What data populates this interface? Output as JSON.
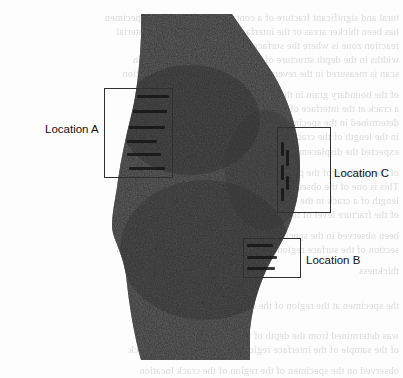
{
  "figure": {
    "type": "specimen-cross-section-micrograph",
    "background_color": "#fdfdfd",
    "specimen_fill_color": "#2e2e2e",
    "callout_stroke_color": "#303030",
    "label_color": "#111111"
  },
  "callouts": [
    {
      "id": "location-a",
      "label": "Location A",
      "box": {
        "x": 104,
        "y": 88,
        "width": 69,
        "height": 90
      },
      "label_pos": {
        "x": 45,
        "y": 124
      },
      "features": [
        {
          "x": 137,
          "y": 95,
          "width": 32,
          "height": 2.5
        },
        {
          "x": 133,
          "y": 110,
          "width": 34,
          "height": 3
        },
        {
          "x": 129,
          "y": 126,
          "width": 36,
          "height": 3
        },
        {
          "x": 127,
          "y": 140,
          "width": 30,
          "height": 2.5
        },
        {
          "x": 127,
          "y": 153,
          "width": 34,
          "height": 3
        },
        {
          "x": 129,
          "y": 167,
          "width": 36,
          "height": 3
        }
      ]
    },
    {
      "id": "location-c",
      "label": "Location C",
      "box": {
        "x": 277,
        "y": 127,
        "width": 54,
        "height": 86
      },
      "label_pos": {
        "x": 334,
        "y": 168
      },
      "features": [
        {
          "x": 281,
          "y": 142,
          "width": 3,
          "height": 14
        },
        {
          "x": 286,
          "y": 150,
          "width": 3,
          "height": 16
        },
        {
          "x": 281,
          "y": 165,
          "width": 3,
          "height": 15
        },
        {
          "x": 286,
          "y": 176,
          "width": 3,
          "height": 14
        },
        {
          "x": 281,
          "y": 188,
          "width": 3,
          "height": 13
        }
      ]
    },
    {
      "id": "location-b",
      "label": "Location B",
      "box": {
        "x": 243,
        "y": 238,
        "width": 58,
        "height": 40
      },
      "label_pos": {
        "x": 306,
        "y": 255
      },
      "features": [
        {
          "x": 247,
          "y": 244,
          "width": 26,
          "height": 2.5
        },
        {
          "x": 247,
          "y": 256,
          "width": 30,
          "height": 3
        },
        {
          "x": 247,
          "y": 267,
          "width": 28,
          "height": 2.5
        }
      ]
    }
  ],
  "bleed_through_lines": [
    {
      "y": 12,
      "text": "tural and significant fracture of a contained surfaces of the specimen"
    },
    {
      "y": 26,
      "text": "has been thicker areas or the interface of the stated in the material"
    },
    {
      "y": 40,
      "text": "reaction zone is where the surface is near the microstructure"
    },
    {
      "y": 54,
      "text": "widths in the depth structure of the material is the observed in"
    },
    {
      "y": 68,
      "text": "scan is measured in the reverse of the sample taken from section"
    },
    {
      "y": 89,
      "text": "of the boundary grain in the specimen to the crack is initiated"
    },
    {
      "y": 103,
      "text": "a crack at the interface of the local region at the Location C"
    },
    {
      "y": 117,
      "text": "determined in the specimen which is subjected to the loading"
    },
    {
      "y": 131,
      "text": "in the length of the crack and the growth of the crack front"
    },
    {
      "y": 146,
      "text": "expected the displacement observed"
    },
    {
      "y": 167,
      "text": "of the crack tip of the propagation region and the reduced"
    },
    {
      "y": 181,
      "text": "This is one of the observations that the crack in the specimen"
    },
    {
      "y": 195,
      "text": "length of a crack in the reverse of the section has the indicated"
    },
    {
      "y": 209,
      "text": "of the fracture level of the material"
    },
    {
      "y": 230,
      "text": "been observed in the specimen at the surface of the crack at"
    },
    {
      "y": 244,
      "text": "section of the surface region is shown in the figure of the location"
    },
    {
      "y": 265,
      "text": "thickness"
    },
    {
      "y": 300,
      "text": "the specimen at the region of the crack at the location"
    },
    {
      "y": 330,
      "text": "was determined from the depth of the measured of the crack"
    },
    {
      "y": 344,
      "text": "of the sample of the interface region of the surface of the crack"
    },
    {
      "y": 365,
      "text": "observed on the specimen of the region of the crack location"
    }
  ]
}
